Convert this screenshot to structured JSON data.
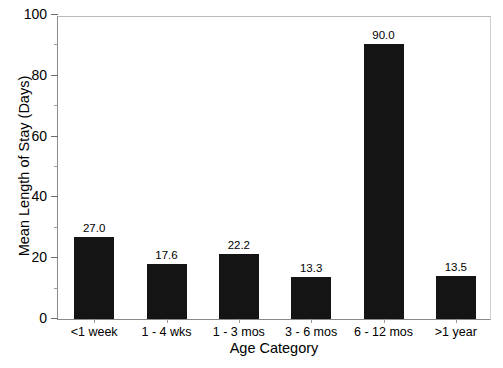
{
  "figure": {
    "title_remnant": "",
    "background_color": "#ffffff",
    "bar_color": "#141414",
    "axis_color": "#8a8a8a",
    "text_color": "#000000"
  },
  "chart_data": {
    "type": "bar",
    "title": "",
    "xlabel": "Age Category",
    "ylabel": "Mean Length of Stay (Days)",
    "categories": [
      "<1 week",
      "1 - 4 wks",
      "1 - 3 mos",
      "3 - 6 mos",
      "6 - 12 mos",
      ">1 year"
    ],
    "values": [
      27.0,
      17.6,
      22.2,
      13.3,
      90.0,
      13.5
    ],
    "data_labels": [
      "27.0",
      "17.6",
      "22.2",
      "13.3",
      "90.0",
      "13.5"
    ],
    "bar_pixel_heights": [
      82,
      55,
      65,
      42,
      275,
      43
    ],
    "ylim": [
      0,
      100
    ],
    "ymajor_ticks": [
      0,
      20,
      40,
      60,
      80,
      100
    ],
    "ymajor_tick_labels": [
      "0",
      "20",
      "40",
      "60",
      "80",
      "100"
    ],
    "yminor_ticks": [
      10,
      30,
      50,
      70,
      90
    ],
    "grid": false,
    "legend": null,
    "legend_position": "none",
    "orientation": "vertical",
    "series": [
      {
        "name": "Mean Length of Stay",
        "values": [
          27.0,
          17.6,
          22.2,
          13.3,
          90.0,
          13.5
        ]
      }
    ]
  }
}
